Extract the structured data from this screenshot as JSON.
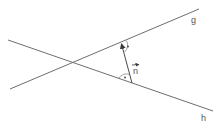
{
  "diagram": {
    "lines": [
      {
        "id": "g",
        "label": "g",
        "x1": 10,
        "y1": 89,
        "x2": 199,
        "y2": 9,
        "label_x": 191,
        "label_y": 23
      },
      {
        "id": "h",
        "label": "h",
        "x1": 8,
        "y1": 40,
        "x2": 213,
        "y2": 111,
        "label_x": 201,
        "label_y": 121
      }
    ],
    "intersection": {
      "x": 73,
      "y": 62
    },
    "normal_vector": {
      "label": "n",
      "label_arrow": "→",
      "from": {
        "x": 132,
        "y": 83
      },
      "to": {
        "x": 121,
        "y": 43
      },
      "label_x": 133,
      "label_y": 74
    },
    "right_angle_marks": [
      {
        "at": "g",
        "symbol": "·"
      },
      {
        "at": "h",
        "symbol": "·"
      }
    ],
    "colors": {
      "lines": "#6e6e6e",
      "vector": "#4a4a4a",
      "text": "#555555",
      "background": "#ffffff"
    }
  }
}
